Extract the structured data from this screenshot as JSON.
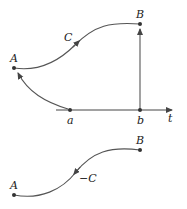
{
  "diagram": {
    "top": {
      "points": {
        "A": {
          "label": "A",
          "x": 14,
          "y": 68
        },
        "B": {
          "label": "B",
          "x": 140,
          "y": 24
        }
      },
      "curve_label": "C",
      "axis": {
        "label": "t",
        "ticks": [
          {
            "label": "a",
            "x": 70
          },
          {
            "label": "b",
            "x": 140
          }
        ]
      }
    },
    "bottom": {
      "points": {
        "A": {
          "label": "A",
          "x": 14,
          "y": 195
        },
        "B": {
          "label": "B",
          "x": 140,
          "y": 150
        }
      },
      "curve_label": "−C"
    },
    "colors": {
      "stroke": "#555555",
      "text": "#222222"
    }
  }
}
